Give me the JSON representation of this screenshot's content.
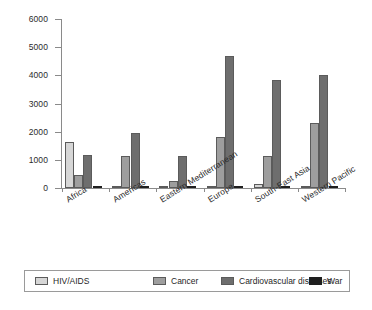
{
  "chart_data": {
    "type": "bar",
    "title": "",
    "subtitle": "",
    "xlabel": "",
    "ylabel": "",
    "ylim": [
      0,
      6000
    ],
    "yticks": [
      0,
      1000,
      2000,
      3000,
      4000,
      5000,
      6000
    ],
    "ytick_labels": [
      "0",
      "1000",
      "2000",
      "3000",
      "4000",
      "5000",
      "6000"
    ],
    "grid": false,
    "legend_position": "bottom",
    "categories": [
      "Africa",
      "Americas",
      "Eastern Mediterranean",
      "Europe",
      "South-East Asia",
      "Western Pacific"
    ],
    "series": [
      {
        "name": "HIV/AIDS",
        "color": "#d6d6d6",
        "values": [
          1630,
          60,
          25,
          20,
          150,
          20
        ]
      },
      {
        "name": "Cancer",
        "color": "#9e9e9e",
        "values": [
          460,
          1150,
          250,
          1810,
          1120,
          2320
        ]
      },
      {
        "name": "Cardiovascular diseases",
        "color": "#6e6e6e",
        "values": [
          1160,
          1940,
          1120,
          4700,
          3820,
          4020
        ]
      },
      {
        "name": "War",
        "color": "#1f1f1f",
        "values": [
          35,
          15,
          75,
          10,
          10,
          10
        ]
      }
    ]
  },
  "legend": {
    "items": [
      {
        "label": "HIV/AIDS",
        "color": "#d6d6d6"
      },
      {
        "label": "Cancer",
        "color": "#9e9e9e"
      },
      {
        "label": "Cardiovascular diseases",
        "color": "#6e6e6e"
      },
      {
        "label": "War",
        "color": "#1f1f1f"
      }
    ]
  },
  "axis": {
    "y_tick_labels": [
      "6000",
      "5000",
      "4000",
      "3000",
      "2000",
      "1000",
      "0"
    ]
  }
}
